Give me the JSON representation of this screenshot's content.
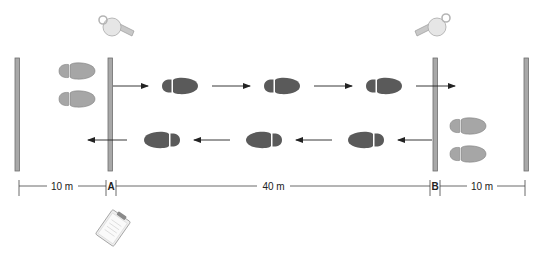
{
  "diagram": {
    "colors": {
      "pole": "#a8a8a8",
      "pole_edge": "#6e6e6e",
      "footprint_dark": "#5a5a5a",
      "footprint_light": "#a6a6a6",
      "arrow": "#222222",
      "dimension_line": "#444444"
    },
    "markers": {
      "A": "A",
      "B": "B"
    },
    "dimensions": {
      "left_zone": "10 m",
      "course": "40 m",
      "right_zone": "10 m"
    },
    "icons": {
      "whistle_left": "whistle-icon",
      "whistle_right": "whistle-icon",
      "clipboard": "clipboard-icon",
      "footprint": "footprint-icon",
      "arrow_right": "arrow-right-icon",
      "arrow_left": "arrow-left-icon"
    }
  }
}
